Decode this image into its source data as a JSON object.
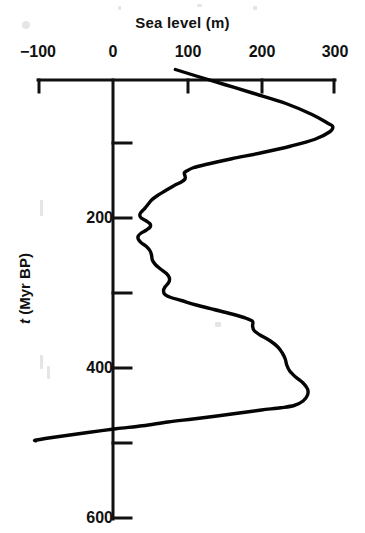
{
  "chart_data": {
    "type": "line",
    "title": "Sea level (m)",
    "xlabel": "Sea level (m)",
    "ylabel": "t (Myr BP)",
    "ylabel_italic_part": "t",
    "ylabel_rest": " (Myr BP)",
    "xlim": [
      -100,
      300
    ],
    "ylim": [
      0,
      600
    ],
    "x_axis_position": "top",
    "y_axis_direction": "down",
    "grid": false,
    "legend": null,
    "xticks": [
      -100,
      0,
      100,
      200,
      300
    ],
    "xtick_labels": [
      "−100",
      "0",
      "100",
      "200",
      "300"
    ],
    "yticks": [
      0,
      100,
      200,
      300,
      400,
      500,
      600
    ],
    "ytick_labels": [
      "",
      "",
      "200",
      "",
      "400",
      "",
      "600"
    ],
    "series": [
      {
        "name": "Phanerozoic sea level",
        "x_unit": "m",
        "y_unit": "Myr BP",
        "points": [
          [
            84,
            2
          ],
          [
            110,
            10
          ],
          [
            150,
            22
          ],
          [
            190,
            34
          ],
          [
            232,
            47
          ],
          [
            268,
            62
          ],
          [
            290,
            74
          ],
          [
            296,
            78
          ],
          [
            292,
            85
          ],
          [
            272,
            95
          ],
          [
            240,
            104
          ],
          [
            200,
            113
          ],
          [
            160,
            121
          ],
          [
            128,
            128
          ],
          [
            108,
            133
          ],
          [
            98,
            138
          ],
          [
            96,
            140
          ],
          [
            97,
            144
          ],
          [
            97,
            148
          ],
          [
            92,
            152
          ],
          [
            82,
            157
          ],
          [
            70,
            164
          ],
          [
            60,
            170
          ],
          [
            52,
            176
          ],
          [
            47,
            182
          ],
          [
            43,
            187
          ],
          [
            38,
            192
          ],
          [
            36,
            196
          ],
          [
            38,
            200
          ],
          [
            45,
            204
          ],
          [
            50,
            208
          ],
          [
            50,
            212
          ],
          [
            45,
            216
          ],
          [
            38,
            220
          ],
          [
            34,
            224
          ],
          [
            34,
            228
          ],
          [
            38,
            233
          ],
          [
            45,
            238
          ],
          [
            50,
            244
          ],
          [
            52,
            250
          ],
          [
            53,
            256
          ],
          [
            57,
            262
          ],
          [
            64,
            268
          ],
          [
            72,
            274
          ],
          [
            76,
            280
          ],
          [
            75,
            286
          ],
          [
            70,
            292
          ],
          [
            68,
            297
          ],
          [
            70,
            302
          ],
          [
            78,
            306
          ],
          [
            92,
            310
          ],
          [
            112,
            316
          ],
          [
            136,
            322
          ],
          [
            160,
            328
          ],
          [
            180,
            334
          ],
          [
            188,
            338
          ],
          [
            188,
            344
          ],
          [
            190,
            350
          ],
          [
            198,
            356
          ],
          [
            212,
            364
          ],
          [
            222,
            372
          ],
          [
            228,
            380
          ],
          [
            232,
            388
          ],
          [
            234,
            396
          ],
          [
            238,
            404
          ],
          [
            246,
            412
          ],
          [
            256,
            420
          ],
          [
            262,
            428
          ],
          [
            262,
            436
          ],
          [
            256,
            444
          ],
          [
            244,
            450
          ],
          [
            226,
            453
          ],
          [
            200,
            456
          ],
          [
            170,
            460
          ],
          [
            140,
            464
          ],
          [
            108,
            468
          ],
          [
            74,
            472
          ],
          [
            40,
            477
          ],
          [
            4,
            481
          ],
          [
            -34,
            486
          ],
          [
            -70,
            491
          ],
          [
            -103,
            496
          ],
          [
            -104,
            497
          ]
        ]
      }
    ]
  },
  "axes": {
    "top_axis_name": "sea-level-axis",
    "left_axis_name": "time-axis"
  }
}
